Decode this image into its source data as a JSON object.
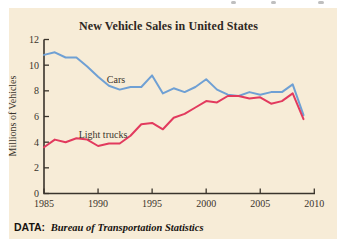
{
  "figure": {
    "title": "New Vehicle Sales in United States",
    "source_label": "DATA:",
    "source_text": "Bureau of Transportation Statistics"
  },
  "colors": {
    "panel_background": "#F7ECD7",
    "axis": "#3A342C",
    "cars_line": "#6FA0D4",
    "light_trucks_line": "#E23A5E",
    "title_text": "#2E2823"
  },
  "chart_data": {
    "type": "line",
    "title": "New Vehicle Sales in United States",
    "xlabel": "",
    "ylabel": "Millions of Vehicles",
    "xlim": [
      1985,
      2010
    ],
    "ylim": [
      0,
      12
    ],
    "x_ticks": [
      1985,
      1990,
      1995,
      2000,
      2005,
      2010
    ],
    "y_ticks": [
      0,
      2,
      4,
      6,
      8,
      10,
      12
    ],
    "grid": false,
    "legend_position": "inline-labels-near-lines",
    "x": [
      1985,
      1986,
      1987,
      1988,
      1989,
      1990,
      1991,
      1992,
      1993,
      1994,
      1995,
      1996,
      1997,
      1998,
      1999,
      2000,
      2001,
      2002,
      2003,
      2004,
      2005,
      2006,
      2007,
      2008,
      2009
    ],
    "series": [
      {
        "name": "Cars",
        "color": "#6FA0D4",
        "values": [
          10.8,
          11.0,
          10.6,
          10.6,
          9.9,
          9.1,
          8.4,
          8.1,
          8.3,
          8.3,
          9.2,
          7.8,
          8.2,
          7.9,
          8.3,
          8.9,
          8.1,
          7.7,
          7.6,
          7.9,
          7.7,
          7.9,
          7.9,
          8.5,
          6.1
        ]
      },
      {
        "name": "Light trucks",
        "color": "#E23A5E",
        "values": [
          3.6,
          4.2,
          4.0,
          4.3,
          4.2,
          3.7,
          3.9,
          3.9,
          4.5,
          5.4,
          5.5,
          5.0,
          5.9,
          6.2,
          6.7,
          7.2,
          7.1,
          7.6,
          7.6,
          7.4,
          7.5,
          7.0,
          7.2,
          7.8,
          5.8
        ]
      }
    ]
  }
}
